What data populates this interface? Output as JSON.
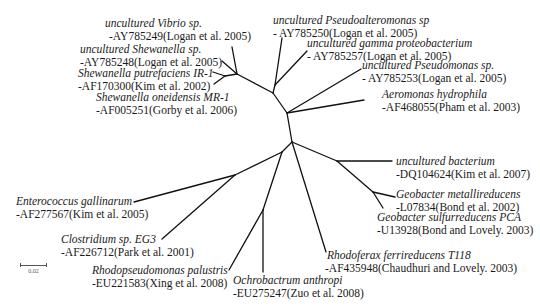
{
  "diagram": {
    "type": "unrooted phylogenetic tree",
    "scale_bar": {
      "label": "0.02"
    },
    "taxa": [
      {
        "id": "vibrio",
        "name": "uncultured Vibrio sp.",
        "accession": "-AY785249(Logan et al. 2005)"
      },
      {
        "id": "shewanella-sp",
        "name": "uncultured Shewanella sp.",
        "accession": "-AY785248(Logan et al. 2005)"
      },
      {
        "id": "shewanella-putrefaciens",
        "name": "Shewanella putrefaciens IR-1",
        "accession": "-AF170300(Kim et al. 2002)"
      },
      {
        "id": "shewanella-oneidensis",
        "name": "Shewanella oneidensis MR-1",
        "accession": "-AF005251(Gorby et al. 2006)"
      },
      {
        "id": "pseudoalteromonas",
        "name": "uncultured Pseudoalteromonas sp",
        "accession": "- AY785250(Logan et al. 2005)"
      },
      {
        "id": "gamma-proteobacterium",
        "name": "uncultured gamma proteobacterium",
        "accession": "- AY785257(Logan et al. 2005)"
      },
      {
        "id": "pseudomonas",
        "name": "uncultured Pseudomonas sp.",
        "accession": "- AY785253(Logan et al. 2005)"
      },
      {
        "id": "aeromonas",
        "name": "Aeromonas hydrophila",
        "accession": "-AF468055(Pham et al. 2003)"
      },
      {
        "id": "uncultured-bacterium",
        "name": "uncultured bacterium",
        "accession": "-DQ104624(Kim et al. 2007)"
      },
      {
        "id": "geobacter-metallireducens",
        "name": "Geobacter metallireducens",
        "accession": "-L07834(Bond et al. 2002)"
      },
      {
        "id": "geobacter-sulfurreducens",
        "name": "Geobacter sulfurreducens PCA",
        "accession": "-U13928(Bond and Lovely. 2003)"
      },
      {
        "id": "rhodoferax",
        "name": "Rhodoferax ferrireducens T118",
        "accession": "-AF435948(Chaudhuri and Lovely. 2003)"
      },
      {
        "id": "ochrobactrum",
        "name": "Ochrobactrum anthropi",
        "accession": "-EU275247(Zuo et al. 2008)"
      },
      {
        "id": "rhodopseudomonas",
        "name": "Rhodopseudomonas palustris",
        "accession": "-EU221583(Xing et al. 2008)"
      },
      {
        "id": "clostridium",
        "name": "Clostridium sp. EG3",
        "accession": "-AF226712(Park et al. 2001)"
      },
      {
        "id": "enterococcus",
        "name": "Enterococcus gallinarum",
        "accession": "-AF277567(Kim et al. 2005)"
      }
    ]
  }
}
